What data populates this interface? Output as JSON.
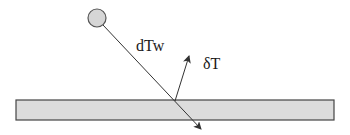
{
  "diagram": {
    "type": "physics-schematic",
    "labels": {
      "incident": "dTw",
      "reflected": "δT"
    },
    "elements": {
      "source": {
        "shape": "circle",
        "cx": 97,
        "cy": 18,
        "r": 9,
        "fill": "#d6d6d6",
        "stroke": "#555555"
      },
      "surface": {
        "shape": "rectangle",
        "x": 16,
        "y": 100,
        "width": 318,
        "height": 20,
        "fill": "#dcdcdc",
        "stroke": "#444444"
      },
      "incident_line": {
        "x1": 103,
        "y1": 25,
        "x2": 201,
        "y2": 129,
        "stroke": "#333333"
      },
      "reflected_arrow": {
        "x1": 175,
        "y1": 101,
        "x2": 189,
        "y2": 56,
        "stroke": "#333333"
      }
    },
    "colors": {
      "line": "#333333",
      "fill_light": "#d8d8d8",
      "text": "#1a1a1a"
    }
  }
}
